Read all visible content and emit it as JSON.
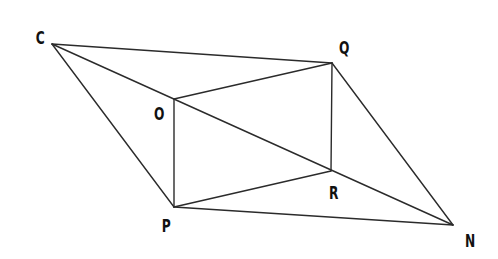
{
  "diagram": {
    "type": "geometry-figure",
    "stroke_color": "#2b2b2b",
    "background": "#ffffff",
    "points": [
      {
        "name": "C",
        "x": 52,
        "y": 44,
        "label_x": 40,
        "label_y": 44
      },
      {
        "name": "Q",
        "x": 332,
        "y": 63,
        "label_x": 343,
        "label_y": 54
      },
      {
        "name": "O",
        "x": 174,
        "y": 99,
        "label_x": 158,
        "label_y": 120
      },
      {
        "name": "P",
        "x": 174,
        "y": 207,
        "label_x": 166,
        "label_y": 232
      },
      {
        "name": "R",
        "x": 331,
        "y": 171,
        "label_x": 333,
        "label_y": 199
      },
      {
        "name": "N",
        "x": 453,
        "y": 225,
        "label_x": 469,
        "label_y": 247
      }
    ],
    "segments": [
      [
        "C",
        "Q"
      ],
      [
        "C",
        "N"
      ],
      [
        "C",
        "P"
      ],
      [
        "O",
        "Q"
      ],
      [
        "O",
        "P"
      ],
      [
        "Q",
        "R"
      ],
      [
        "Q",
        "N"
      ],
      [
        "P",
        "R"
      ],
      [
        "P",
        "N"
      ]
    ],
    "labels": {
      "C": "C",
      "Q": "Q",
      "O": "O",
      "P": "P",
      "R": "R",
      "N": "N"
    }
  }
}
